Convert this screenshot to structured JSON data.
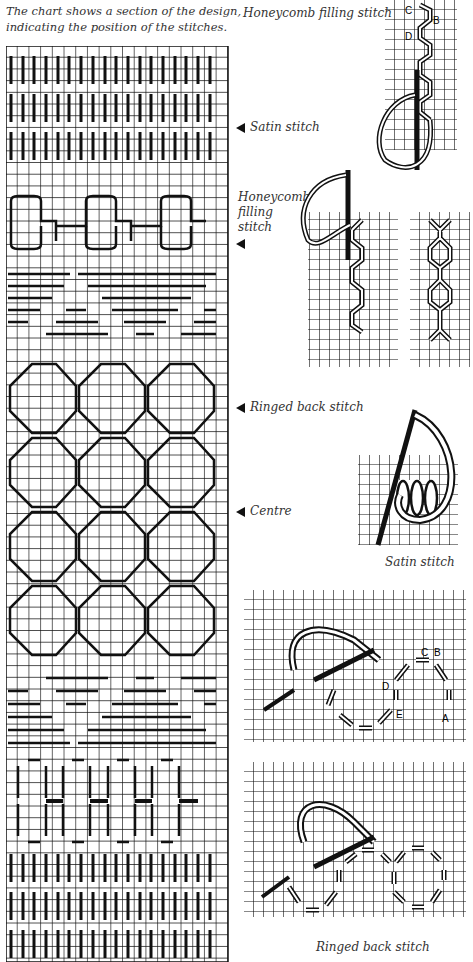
{
  "intro": {
    "line1": "The chart shows a section of the design,",
    "line2": "indicating the position of the stitches."
  },
  "chart_labels": {
    "satin": "Satin stitch",
    "honeycomb_1": "Honeycomb",
    "honeycomb_2": "filling",
    "honeycomb_3": "stitch",
    "ringed": "Ringed back stitch",
    "centre": "Centre"
  },
  "diagram_captions": {
    "honeycomb_top": "Honeycomb filling stitch",
    "satin": "Satin stitch",
    "ringed": "Ringed back stitch"
  },
  "diagram_letters": {
    "honeycomb": [
      "C",
      "B",
      "D"
    ],
    "ringed": [
      "C",
      "B",
      "D",
      "E",
      "A"
    ]
  },
  "colors": {
    "ink": "#111111",
    "paper": "#ffffff",
    "text": "#333333"
  }
}
